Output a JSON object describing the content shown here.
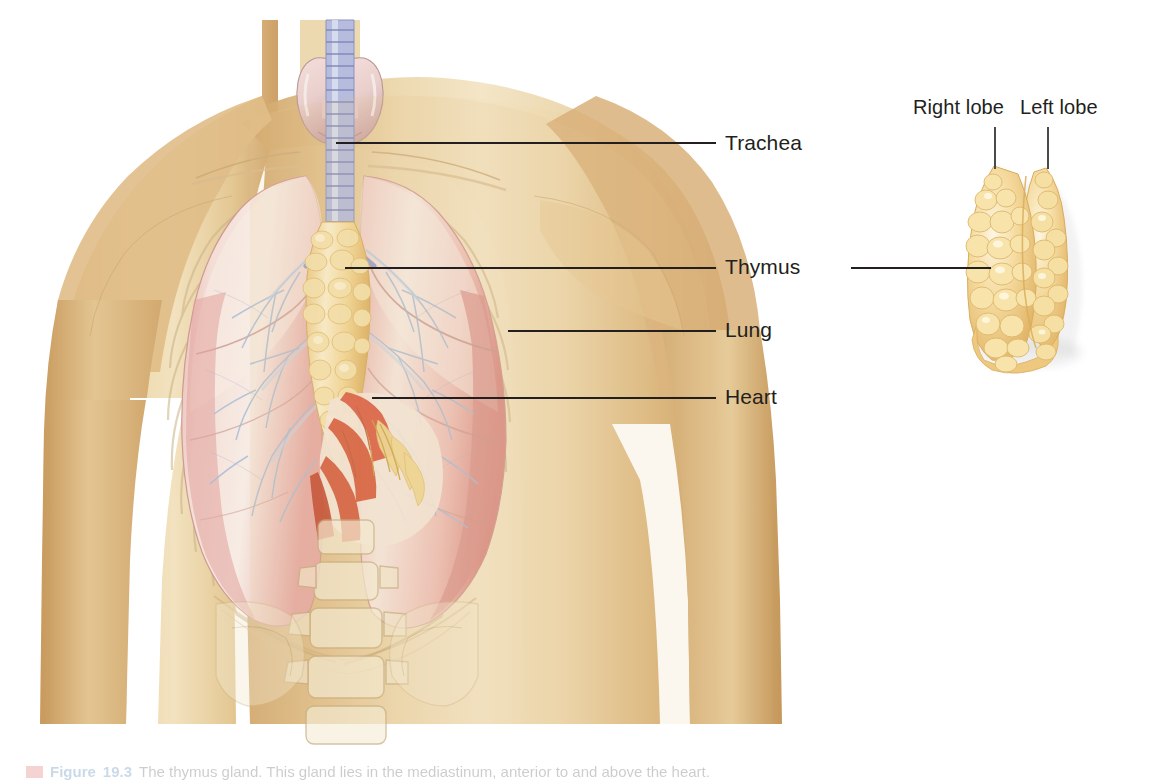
{
  "figure": {
    "caption_marker_color": "#d9534f",
    "caption_number": "19.3",
    "caption_label": "Figure",
    "caption_text": "The thymus gland. This gland lies in the mediastinum, anterior to and above the heart."
  },
  "labels": [
    {
      "id": "trachea",
      "text": "Trachea",
      "x": 725,
      "y": 131,
      "leader": {
        "x": 336,
        "y": 143,
        "w": 380
      }
    },
    {
      "id": "thymus",
      "text": "Thymus",
      "x": 725,
      "y": 255,
      "leader": {
        "x": 345,
        "y": 268,
        "w": 372
      },
      "leader_right": {
        "x": 851,
        "y": 268,
        "w": 140
      }
    },
    {
      "id": "lung",
      "text": "Lung",
      "x": 725,
      "y": 318,
      "leader": {
        "x": 508,
        "y": 331,
        "w": 208
      }
    },
    {
      "id": "heart",
      "text": "Heart",
      "x": 725,
      "y": 385,
      "leader": {
        "x": 372,
        "y": 398,
        "w": 344
      }
    }
  ],
  "inset_labels": [
    {
      "id": "right-lobe",
      "text": "Right lobe",
      "x": 913,
      "y": 96,
      "pointer": {
        "x": 995,
        "y": 127,
        "h": 42
      }
    },
    {
      "id": "left-lobe",
      "text": "Left lobe",
      "x": 1020,
      "y": 96,
      "pointer": {
        "x": 1048,
        "y": 127,
        "h": 42
      }
    }
  ],
  "structures": {
    "skin": "#dfbd85",
    "skin_light": "#ecd6a8",
    "skin_shadow": "#c9a061",
    "bone": "#f2e6c8",
    "lung": "#e9bdb6",
    "lung_pink": "#dd9e98",
    "lung_pale": "#f6ece4",
    "thyroid": "#eccfcd",
    "trachea": "#9fa4cd",
    "thymus_gland": "#f0cd86",
    "thymus_highlight": "#fdf3d8",
    "heart_red": "#d9543a",
    "vessel_blue": "#9fb4cf",
    "fat_yellow": "#f0dca0"
  },
  "inset": {
    "name": "thymus-detail",
    "description": "Isolated lobulated thymus gland showing right and left lobes",
    "x": 955,
    "y": 160,
    "w": 130,
    "h": 200
  }
}
